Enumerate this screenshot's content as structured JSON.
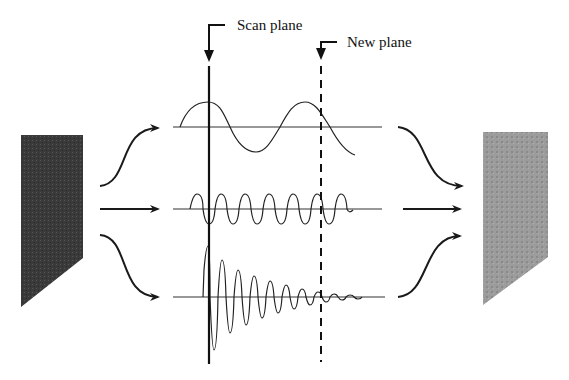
{
  "labels": {
    "scan_plane": "Scan plane",
    "new_plane": "New plane"
  },
  "colors": {
    "ink": "#1a1a1a",
    "input_block": "#3c3c3c",
    "output_block": "#9a9a9a",
    "background": "#ffffff"
  },
  "elements": {
    "input_block": "dark focused sample block (left)",
    "output_block": "blurred sample block (right)",
    "waves": [
      {
        "name": "low-frequency",
        "type": "sine",
        "baseline_y": 127
      },
      {
        "name": "mid-frequency",
        "type": "sine",
        "baseline_y": 209
      },
      {
        "name": "decaying",
        "type": "damped-sine",
        "baseline_y": 297
      }
    ]
  }
}
